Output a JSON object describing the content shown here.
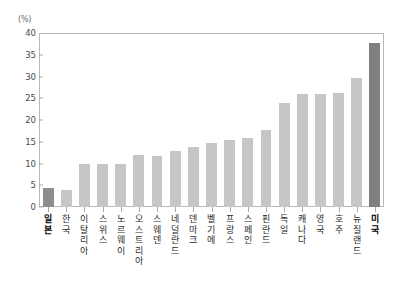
{
  "chart_data": {
    "type": "bar",
    "title": "",
    "subtitle": "",
    "xlabel": "",
    "ylabel": "(%)",
    "unit_label": "(%)",
    "ylim": [
      0,
      40
    ],
    "ytick_step": 5,
    "ytick_labels": [
      "0",
      "5",
      "10",
      "15",
      "20",
      "25",
      "30",
      "35",
      "40"
    ],
    "ytick_values": [
      0,
      5,
      10,
      15,
      20,
      25,
      30,
      35,
      40
    ],
    "grid": false,
    "legend": "none",
    "categories": [
      "일본",
      "한국",
      "이탈리아",
      "스위스",
      "노르웨이",
      "오스트리아",
      "스웨덴",
      "네덜란드",
      "덴마크",
      "벨기에",
      "프랑스",
      "스페인",
      "핀란드",
      "독일",
      "캐나다",
      "영국",
      "호주",
      "뉴질랜드",
      "미국"
    ],
    "values": [
      4.3,
      4.0,
      10.0,
      10.0,
      9.9,
      12.0,
      11.8,
      12.8,
      13.7,
      14.8,
      15.3,
      15.8,
      17.8,
      24.0,
      26.0,
      26.0,
      26.3,
      29.6,
      37.7
    ],
    "highlighted": [
      "일본",
      "미국"
    ],
    "colors": {
      "bar": "#c6c6c6",
      "bar_highlight_japan": "#8d8d8d",
      "bar_highlight_usa": "#7f7f7f",
      "axis": "#b9b9b9",
      "tick": "#a8a8a8",
      "tick_label": "#4a4a4a",
      "category_label": "#2b2b2b",
      "background": "#ffffff"
    }
  }
}
